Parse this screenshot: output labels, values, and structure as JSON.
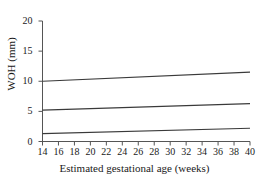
{
  "chart_data": {
    "type": "line",
    "title": "",
    "subtitle": "",
    "xlabel": "Estimated gestational age (weeks)",
    "ylabel": "WOH (mm)",
    "xlim": [
      14,
      40
    ],
    "ylim": [
      0,
      20
    ],
    "xticks": [
      14,
      16,
      18,
      20,
      22,
      24,
      26,
      28,
      30,
      32,
      34,
      36,
      38,
      40
    ],
    "yticks": [
      0,
      5,
      10,
      15,
      20
    ],
    "xtick_labels": [
      "14",
      "16",
      "18",
      "20",
      "22",
      "24",
      "26",
      "28",
      "30",
      "32",
      "34",
      "36",
      "38",
      "40"
    ],
    "ytick_labels": [
      "0",
      "5",
      "10",
      "15",
      "20"
    ],
    "grid": false,
    "legend": "none",
    "line_color": "#3a3a3a",
    "axis_color": "#555555",
    "background": "#ffffff",
    "x": [
      14,
      40
    ],
    "series": [
      {
        "name": "upper centile",
        "values": [
          10.0,
          11.5
        ]
      },
      {
        "name": "median",
        "values": [
          5.2,
          6.3
        ]
      },
      {
        "name": "lower centile",
        "values": [
          1.3,
          2.2
        ]
      }
    ]
  }
}
